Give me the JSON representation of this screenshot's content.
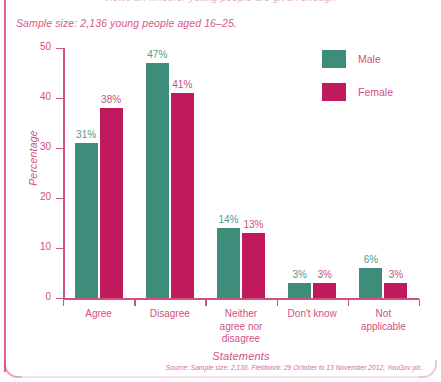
{
  "caption": {
    "sample_size": "Sample size: 2,136 young people aged 16–25.",
    "top_clipped": "views on whether young people are given enough"
  },
  "legend": {
    "position": "top-right",
    "items": [
      {
        "label": "Male",
        "color": "#3e8d7b",
        "icon": "square-swatch"
      },
      {
        "label": "Female",
        "color": "#c01a5c",
        "icon": "square-swatch"
      }
    ]
  },
  "axes": {
    "y_title": "Percentage",
    "x_title": "Statements",
    "y_ticks": [
      "0",
      "10",
      "20",
      "30",
      "40",
      "50"
    ]
  },
  "source": "Source: Sample size: 2,136. Fieldwork: 29 October to 13 November 2012, YouGov plc.",
  "colors": {
    "male": "#3e8d7b",
    "female": "#c01a5c",
    "axis": "#cf5183",
    "text": "#cf5183",
    "frame": "#d9467e",
    "background": "#ffffff"
  },
  "chart_data": {
    "type": "bar",
    "title": "",
    "subtitle": "Sample size: 2,136 young people aged 16–25.",
    "categories": [
      "Agree",
      "Disagree",
      "Neither agree nor disagree",
      "Don't know",
      "Not applicable"
    ],
    "category_lines": [
      [
        "Agree"
      ],
      [
        "Disagree"
      ],
      [
        "Neither",
        "agree nor",
        "disagree"
      ],
      [
        "Don't know"
      ],
      [
        "Not",
        "applicable"
      ]
    ],
    "series": [
      {
        "name": "Male",
        "color": "#3e8d7b",
        "values": [
          31,
          47,
          14,
          3,
          6
        ],
        "labels": [
          "31%",
          "47%",
          "14%",
          "3%",
          "6%"
        ]
      },
      {
        "name": "Female",
        "color": "#c01a5c",
        "values": [
          38,
          41,
          13,
          3,
          3
        ],
        "labels": [
          "38%",
          "41%",
          "13%",
          "3%",
          "3%"
        ]
      }
    ],
    "xlabel": "Statements",
    "ylabel": "Percentage",
    "ylim": [
      0,
      50
    ],
    "yticks": [
      0,
      10,
      20,
      30,
      40,
      50
    ],
    "grid": false,
    "legend_position": "top-right",
    "value_unit": "%"
  }
}
